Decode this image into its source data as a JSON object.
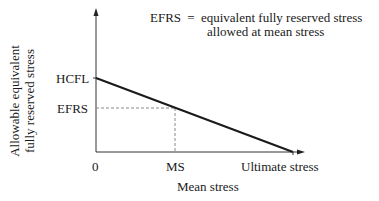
{
  "diagram": {
    "y_axis_label": [
      "Allowable equivalent",
      "fully reserved stress"
    ],
    "x_axis_label": "Mean stress",
    "y_ticks": {
      "hcfl": "HCFL",
      "efrs": "EFRS"
    },
    "x_ticks": {
      "origin": "0",
      "ms": "MS",
      "ultimate": "Ultimate stress"
    },
    "legend": {
      "term": "EFRS",
      "equals": "=",
      "definition_line1": "equivalent fully reserved stress",
      "definition_line2": "allowed at mean stress"
    },
    "colors": {
      "line": "#1a1a1a",
      "axis": "#333333",
      "dashed": "#888888"
    }
  }
}
